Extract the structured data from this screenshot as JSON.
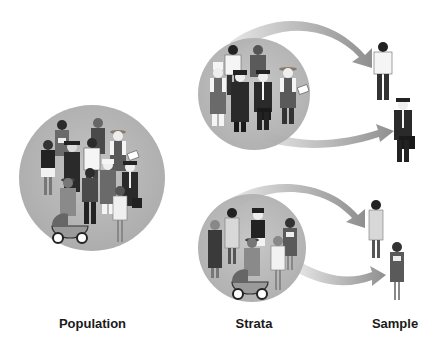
{
  "labels": {
    "population": "Population",
    "strata": "Strata",
    "sample": "Sample"
  },
  "diagram": {
    "type": "stratified-sampling",
    "groups": [
      {
        "name": "population",
        "description": "Mixed group of people of various occupations and genders"
      },
      {
        "name": "stratum-men",
        "description": "Men of various occupations",
        "sampled": [
          "man in white shirt",
          "businessman with briefcase"
        ]
      },
      {
        "name": "stratum-women",
        "description": "Women of various occupations",
        "sampled": [
          "woman in light dress",
          "woman in dark dress holding papers"
        ]
      }
    ],
    "colors": {
      "circle": "#b9b9b9",
      "arrow": "#a8a8a8",
      "text": "#1a1a1a"
    }
  }
}
